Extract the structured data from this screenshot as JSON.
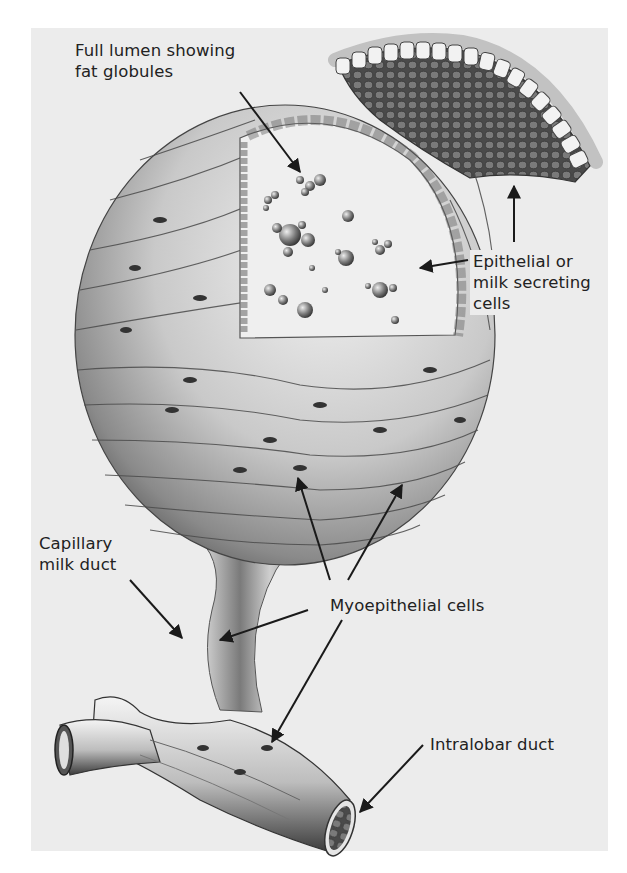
{
  "figure": {
    "background_color": "#ececec",
    "ink_color": "#222222"
  },
  "labels": {
    "lumen_line1": "Full lumen showing",
    "lumen_line2": "fat globules",
    "epithelial_line1": "Epithelial or",
    "epithelial_line2": "milk secreting",
    "epithelial_line3": "cells",
    "capillary_line1": "Capillary",
    "capillary_line2": "milk duct",
    "myoepithelial": "Myoepithelial cells",
    "intralobar": "Intralobar duct"
  },
  "icons": {
    "arrows": [
      "lumen-arrow",
      "epithelial-arrow",
      "inset-arrow",
      "capillary-arrow",
      "myo-arrow-1",
      "myo-arrow-2",
      "myo-arrow-3",
      "myo-arrow-4",
      "intralobar-arrow"
    ]
  }
}
